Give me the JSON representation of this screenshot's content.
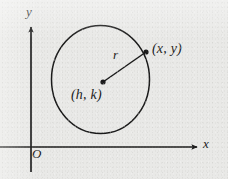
{
  "figure": {
    "background_color": "#e9e9e7",
    "ink_color": "#1a1a1a",
    "axes": {
      "y_axis_label": "y",
      "x_axis_label": "x",
      "origin_label": "O"
    },
    "labels": {
      "radius": "r",
      "point_on_circle": "(x, y)",
      "center": "(h, k)"
    },
    "geometry": {
      "circle_center_px": [
        100.5,
        79.5
      ],
      "circle_radius_x_px": 49,
      "circle_radius_y_px": 54,
      "center_dot_px": [
        103,
        82
      ],
      "circle_point_dot_px": [
        146,
        52
      ],
      "x_axis_y_px": 147,
      "y_axis_x_px": 31,
      "x_axis_arrow_tip_px": [
        199,
        147
      ],
      "y_axis_arrow_tip_px": [
        31,
        25
      ]
    }
  }
}
